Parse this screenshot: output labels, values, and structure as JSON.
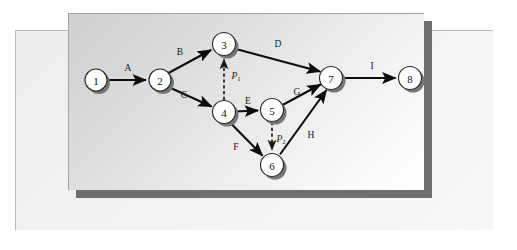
{
  "figure": {
    "type": "activity-on-arrow-network-diagram",
    "title": "",
    "panels": {
      "back_sheet_color": "#f2f2f2",
      "front_sheet_color": "#dcdcdc",
      "shadow_color": "#6f6f6f"
    }
  },
  "nodes": [
    {
      "id": "1",
      "label": "1",
      "cx": 96,
      "cy": 80,
      "r": 11
    },
    {
      "id": "2",
      "label": "2",
      "cx": 160,
      "cy": 80,
      "r": 11
    },
    {
      "id": "3",
      "label": "3",
      "cx": 224,
      "cy": 44,
      "r": 11.5
    },
    {
      "id": "4",
      "label": "4",
      "cx": 224,
      "cy": 112,
      "r": 11.5
    },
    {
      "id": "5",
      "label": "5",
      "cx": 272,
      "cy": 110,
      "r": 11.5
    },
    {
      "id": "6",
      "label": "6",
      "cx": 272,
      "cy": 165,
      "r": 11.5
    },
    {
      "id": "7",
      "label": "7",
      "cx": 331,
      "cy": 78,
      "r": 11.5
    },
    {
      "id": "8",
      "label": "8",
      "cx": 410,
      "cy": 78,
      "r": 11.5
    }
  ],
  "edges": [
    {
      "id": "A",
      "label": "A",
      "from": "1",
      "to": "2",
      "style": "solid",
      "label_x": 128,
      "label_y": 68
    },
    {
      "id": "B",
      "label": "B",
      "from": "2",
      "to": "3",
      "style": "solid",
      "label_x": 180,
      "label_y": 52
    },
    {
      "id": "C",
      "label": "C",
      "from": "2",
      "to": "4",
      "style": "solid",
      "label_x": 184,
      "label_y": 95
    },
    {
      "id": "D",
      "label": "D",
      "from": "3",
      "to": "7",
      "style": "solid",
      "label_x": 278,
      "label_y": 44
    },
    {
      "id": "E",
      "label": "E",
      "from": "4",
      "to": "5",
      "style": "solid",
      "label_x": 248,
      "label_y": 101
    },
    {
      "id": "F",
      "label": "F",
      "from": "4",
      "to": "6",
      "style": "solid",
      "label_x": 236,
      "label_y": 147
    },
    {
      "id": "G",
      "label": "G",
      "from": "5",
      "to": "7",
      "style": "solid",
      "label_x": 297,
      "label_y": 92
    },
    {
      "id": "H",
      "label": "H",
      "from": "6",
      "to": "7",
      "style": "solid",
      "label_x": 311,
      "label_y": 135
    },
    {
      "id": "I",
      "label": "I",
      "from": "7",
      "to": "8",
      "style": "solid",
      "label_x": 372,
      "label_y": 66
    },
    {
      "id": "P1",
      "label": "P",
      "sub": "1",
      "from": "4",
      "to": "3",
      "style": "dashed",
      "label_x": 236,
      "label_y": 76
    },
    {
      "id": "P2",
      "label": "P",
      "sub": "2",
      "from": "5",
      "to": "6",
      "style": "dashed",
      "label_x": 285,
      "label_y": 139
    }
  ],
  "colors": {
    "edge": "#0d0d0d",
    "node_fill": "#ffffff",
    "node_stroke": "#2b2b2b",
    "node_shadow": "#767676",
    "text": "#111111"
  }
}
